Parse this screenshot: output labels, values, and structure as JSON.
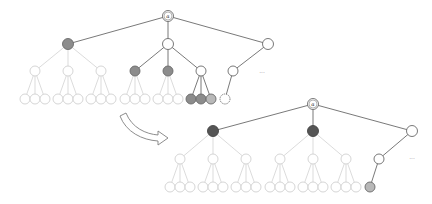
{
  "diagram": {
    "colors": {
      "dark_edge": "#6a6a6a",
      "light_edge": "#d2d2d2",
      "gray_node": "#8c8c8c",
      "dark_node": "#555555",
      "light_gray_node": "#b8b8b8"
    },
    "top_tree": {
      "root_label": "α",
      "middle_child_label": "",
      "inner_leaf_label": "",
      "right_leaf_label": "",
      "ellipsis": "..."
    },
    "bottom_tree": {
      "root_label": "α",
      "middle_child_label": "",
      "right_leaf_label": "",
      "ellipsis": "..."
    },
    "arrow": {
      "style": "hollow-curved",
      "direction": "top-tree-to-bottom-tree"
    }
  }
}
